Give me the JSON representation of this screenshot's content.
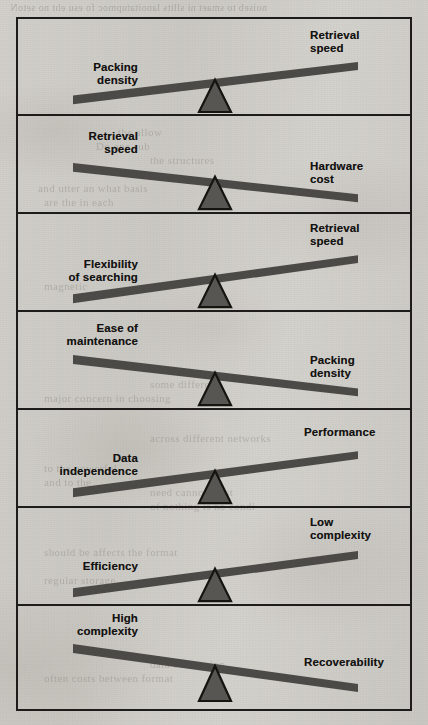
{
  "figure": {
    "type": "seesaw-tradeoff-diagram",
    "panel_count": 7,
    "frame_color": "#1d1c1a",
    "beam_color": "#4c4a47",
    "fulcrum_fill": "#585652",
    "fulcrum_stroke": "#15140f",
    "paper_color": "#d0cec9"
  },
  "panels": [
    {
      "id": "panel-1",
      "left": {
        "label": "Packing\ndensity",
        "line1": "Packing",
        "line2": "density",
        "side": "down"
      },
      "right": {
        "label": "Retrieval\nspeed",
        "line1": "Retrieval",
        "line2": "speed",
        "side": "up"
      },
      "tilt": "right-up"
    },
    {
      "id": "panel-2",
      "left": {
        "label": "Retrieval\nspeed",
        "line1": "Retrieval",
        "line2": "speed",
        "side": "up"
      },
      "right": {
        "label": "Hardware\ncost",
        "line1": "Hardware",
        "line2": "cost",
        "side": "down"
      },
      "tilt": "left-up"
    },
    {
      "id": "panel-3",
      "left": {
        "label": "Flexibility\nof searching",
        "line1": "Flexibility",
        "line2": "of searching",
        "side": "down"
      },
      "right": {
        "label": "Retrieval\nspeed",
        "line1": "Retrieval",
        "line2": "speed",
        "side": "up"
      },
      "tilt": "right-up"
    },
    {
      "id": "panel-4",
      "left": {
        "label": "Ease of\nmaintenance",
        "line1": "Ease of",
        "line2": "maintenance",
        "side": "up"
      },
      "right": {
        "label": "Packing\ndensity",
        "line1": "Packing",
        "line2": "density",
        "side": "down"
      },
      "tilt": "left-up"
    },
    {
      "id": "panel-5",
      "left": {
        "label": "Data\nindependence",
        "line1": "Data",
        "line2": "independence",
        "side": "down"
      },
      "right": {
        "label": "Performance",
        "line1": "Performance",
        "line2": "",
        "side": "up"
      },
      "tilt": "right-up"
    },
    {
      "id": "panel-6",
      "left": {
        "label": "Efficiency",
        "line1": "Efficiency",
        "line2": "",
        "side": "down"
      },
      "right": {
        "label": "Low\ncomplexity",
        "line1": "Low",
        "line2": "complexity",
        "side": "up"
      },
      "tilt": "right-up"
    },
    {
      "id": "panel-7",
      "left": {
        "label": "High\ncomplexity",
        "line1": "High",
        "line2": "complexity",
        "side": "up"
      },
      "right": {
        "label": "Recoverability",
        "line1": "Recoverability",
        "line2": "",
        "side": "down"
      },
      "tilt": "left-up"
    }
  ],
  "bleed_through": {
    "description": "faint mirrored text showing through from the reverse side of the scanned page",
    "top_line": "noiseb to smaet ni sllits lanoitatupmoc fo esu eht no setoN",
    "side_fragments": [
      "the allow",
      "Do one sub",
      "the structures",
      "and utter an what basis",
      "are the in each",
      "magnetic",
      "some different",
      "major concern in choosing",
      "across different networks",
      "to the powerful",
      "and to the",
      "need cannot exist",
      "of nothing is no condi",
      "should be affects the format",
      "regular storage",
      "data conversion",
      "often costs between format"
    ]
  }
}
